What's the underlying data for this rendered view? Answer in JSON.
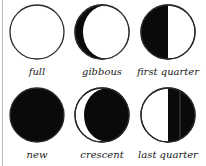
{
  "phases": [
    {
      "label": "full"
    },
    {
      "label": "gibbous"
    },
    {
      "label": "first quarter"
    },
    {
      "label": "new"
    },
    {
      "label": "crescent"
    },
    {
      "label": "last quarter"
    }
  ],
  "colors": {
    "dark": "#0a0a0a",
    "light": "#ffffff",
    "outline": "#2a2a2a"
  }
}
